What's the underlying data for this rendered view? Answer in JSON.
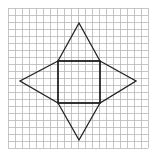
{
  "diagram": {
    "type": "net-of-square-pyramid",
    "background": "#ffffff",
    "grid": {
      "x0": 8,
      "y0": 8,
      "x1": 148,
      "y1": 148,
      "spacing": 7,
      "color": "#b8b8b8"
    },
    "shape": {
      "stroke": "#222222",
      "stroke_width": 1.3,
      "square": {
        "x": 58,
        "y": 61,
        "w": 42,
        "h": 42
      },
      "apexes": {
        "top": [
          79,
          23
        ],
        "right": [
          136,
          81
        ],
        "bottom": [
          79,
          140
        ],
        "left": [
          20,
          81
        ]
      }
    }
  }
}
